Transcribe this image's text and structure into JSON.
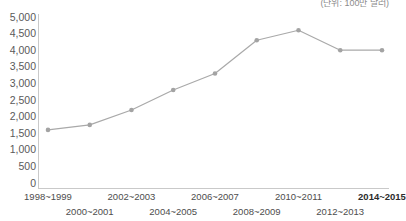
{
  "unit_note": "(단위: 100만 달러)",
  "colors": {
    "line": "#a9a9a9",
    "marker": "#a3a3a3",
    "axis": "#c9c9c9",
    "tick_text": "#5a5a5a",
    "background": "#ffffff"
  },
  "chart_data": {
    "type": "line",
    "title": "",
    "subtitle": "",
    "xlabel": "",
    "ylabel": "",
    "unit_note": "(단위: 100만 달러)",
    "grid": false,
    "legend": false,
    "ylim": [
      0,
      5000
    ],
    "ytick_step": 500,
    "categories": [
      "1998~1999",
      "2000~2001",
      "2002~2003",
      "2004~2005",
      "2006~2007",
      "2008~2009",
      "2010~2011",
      "2012~2013",
      "2014~2015"
    ],
    "values": [
      1600,
      1750,
      2200,
      2800,
      3300,
      4300,
      4600,
      4000,
      4000
    ],
    "ytick_labels": [
      "5,000",
      "4,500",
      "4,000",
      "3,500",
      "3,000",
      "2,500",
      "2,000",
      "1,500",
      "1,000",
      "500",
      "0"
    ],
    "ytick_values": [
      5000,
      4500,
      4000,
      3500,
      3000,
      2500,
      2000,
      1500,
      1000,
      500,
      0
    ],
    "xtick_labels": [
      {
        "label": "1998~1999",
        "row": "top",
        "emphasis": false
      },
      {
        "label": "2000~2001",
        "row": "bottom",
        "emphasis": false
      },
      {
        "label": "2002~2003",
        "row": "top",
        "emphasis": false
      },
      {
        "label": "2004~2005",
        "row": "bottom",
        "emphasis": false
      },
      {
        "label": "2006~2007",
        "row": "top",
        "emphasis": false
      },
      {
        "label": "2008~2009",
        "row": "bottom",
        "emphasis": false
      },
      {
        "label": "2010~2011",
        "row": "top",
        "emphasis": false
      },
      {
        "label": "2012~2013",
        "row": "bottom",
        "emphasis": false
      },
      {
        "label": "2014~2015",
        "row": "top",
        "emphasis": true
      }
    ]
  }
}
